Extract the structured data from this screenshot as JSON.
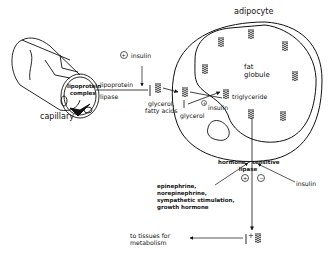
{
  "diagram": {
    "type": "biochemical-pathway",
    "nodes": {
      "capillary": "capillary",
      "lipoprotein_complex": [
        "lipoprotein",
        "complex"
      ],
      "lipoprotein_lipase": [
        "lipoprotein",
        "lipase"
      ],
      "insulin_top": "insulin",
      "glycerol_fatty_acids": [
        "glycerol,",
        "fatty acids"
      ],
      "adipocyte": "adipocyte",
      "fat_globule": [
        "fat",
        "globule"
      ],
      "triglyceride": "triglyceride",
      "glycerol": "glycerol",
      "insulin_inner": "insulin",
      "hormone_sensitive_lipase": [
        "hormone - sensitive",
        "lipase"
      ],
      "stimulators": [
        "epinephrine,",
        "norepinephrine,",
        "sympathetic stimulation,",
        "growth hormone"
      ],
      "insulin_right": "insulin",
      "to_tissues": [
        "to tissues for",
        "metabolism"
      ]
    },
    "signs": {
      "insulin_top": "+",
      "insulin_inner": "+",
      "stimulators_effect": "+",
      "insulin_right_effect": "−",
      "output_plus": "+"
    },
    "edges": [
      {
        "from": "lipoprotein_complex",
        "to": "glycerol_fatty_acids",
        "label": "lipoprotein lipase",
        "modulator": "insulin",
        "effect": "+"
      },
      {
        "from": "glycerol_fatty_acids",
        "to": "adipocyte",
        "label": ""
      },
      {
        "from": "glycerol",
        "to": "triglyceride",
        "modulator": "insulin",
        "effect": "+"
      },
      {
        "from": "triglyceride",
        "to": "output",
        "label": "hormone-sensitive lipase"
      },
      {
        "from": "stimulators",
        "to": "hormone_sensitive_lipase",
        "effect": "+"
      },
      {
        "from": "insulin_right",
        "to": "hormone_sensitive_lipase",
        "effect": "−"
      },
      {
        "from": "output",
        "to": "to_tissues"
      }
    ],
    "colors": {
      "ink": "#111111",
      "background": "#ffffff"
    }
  }
}
